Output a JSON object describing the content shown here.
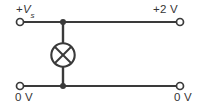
{
  "diagram": {
    "type": "electrical-schematic",
    "width": 201,
    "height": 111,
    "background_color": "#ffffff",
    "stroke_color": "#3a3a3a",
    "labels": {
      "top_left": {
        "prefix": "+",
        "symbol": "V",
        "subscript": "s",
        "full_text": "+Vs"
      },
      "top_right": {
        "text": "+2 V"
      },
      "bottom_left": {
        "text": "0 V"
      },
      "bottom_right": {
        "text": "0 V"
      }
    },
    "terminals": [
      {
        "name": "terminal-top-left",
        "x": 20,
        "y": 22,
        "r": 3.6,
        "label": "+Vs"
      },
      {
        "name": "terminal-top-right",
        "x": 180,
        "y": 22,
        "r": 3.6,
        "label": "+2 V"
      },
      {
        "name": "terminal-bottom-left",
        "x": 20,
        "y": 86,
        "r": 3.6,
        "label": "0 V"
      },
      {
        "name": "terminal-bottom-right",
        "x": 180,
        "y": 86,
        "r": 3.6,
        "label": "0 V"
      }
    ],
    "wires": [
      {
        "name": "wire-top",
        "x1": 24,
        "y1": 22,
        "x2": 177,
        "y2": 22
      },
      {
        "name": "wire-bottom",
        "x1": 24,
        "y1": 86,
        "x2": 177,
        "y2": 86
      },
      {
        "name": "wire-vertical-upper",
        "x1": 63,
        "y1": 22,
        "x2": 63,
        "y2": 43
      },
      {
        "name": "wire-vertical-lower",
        "x1": 63,
        "y1": 67,
        "x2": 63,
        "y2": 86
      }
    ],
    "junctions": [
      {
        "name": "junction-top",
        "x": 63,
        "y": 22,
        "r": 3.0
      },
      {
        "name": "junction-bottom",
        "x": 63,
        "y": 86,
        "r": 3.0
      }
    ],
    "components": [
      {
        "name": "lamp",
        "symbol": "lamp-icon",
        "description": "circle with diagonal cross (filament lamp)",
        "cx": 63,
        "cy": 55,
        "r": 12
      }
    ]
  }
}
